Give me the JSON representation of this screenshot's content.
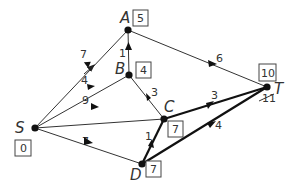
{
  "diagram": {
    "type": "shortest-path-graph",
    "nodes": [
      {
        "id": "S",
        "label": "S",
        "value": "0",
        "x": 35,
        "y": 128
      },
      {
        "id": "A",
        "label": "A",
        "value": "5",
        "x": 128,
        "y": 30
      },
      {
        "id": "B",
        "label": "B",
        "value": "4",
        "x": 129,
        "y": 75
      },
      {
        "id": "C",
        "label": "C",
        "value": "7",
        "x": 164,
        "y": 119
      },
      {
        "id": "D",
        "label": "D",
        "value": "7",
        "x": 142,
        "y": 164
      },
      {
        "id": "T",
        "label": "T",
        "value": "10",
        "crossed_value": "11",
        "x": 267,
        "y": 87
      }
    ],
    "edges": [
      {
        "from": "S",
        "to": "A",
        "weight": "7",
        "bold": false
      },
      {
        "from": "S",
        "to": "B",
        "weight": "4",
        "bold": false
      },
      {
        "from": "S",
        "to": "C",
        "weight": "9",
        "bold": false
      },
      {
        "from": "S",
        "to": "D",
        "weight": "7",
        "bold": false
      },
      {
        "from": "B",
        "to": "A",
        "weight": "1",
        "bold": false
      },
      {
        "from": "B",
        "to": "C",
        "weight": "3",
        "bold": false
      },
      {
        "from": "A",
        "to": "T",
        "weight": "6",
        "bold": false
      },
      {
        "from": "C",
        "to": "T",
        "weight": "3",
        "bold": true
      },
      {
        "from": "D",
        "to": "C",
        "weight": "1",
        "bold": true
      },
      {
        "from": "D",
        "to": "T",
        "weight": "4",
        "bold": true
      }
    ]
  }
}
